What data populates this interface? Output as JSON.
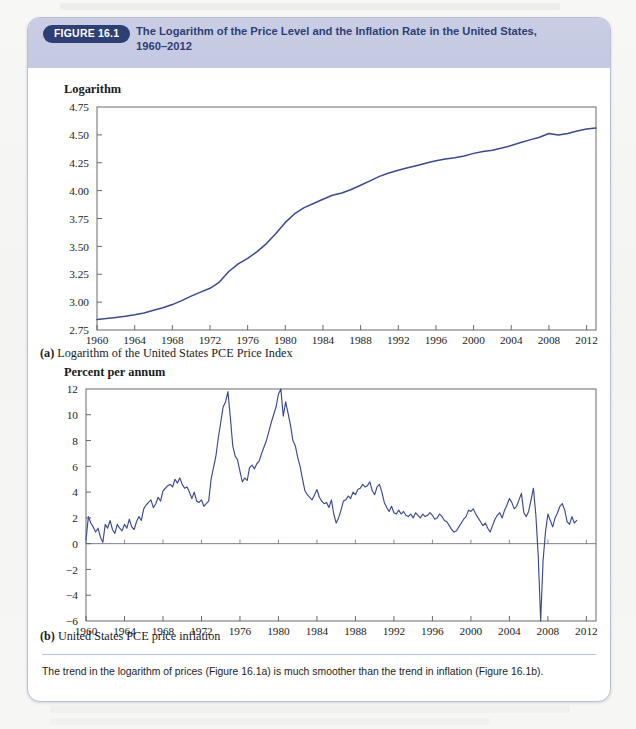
{
  "figure": {
    "badge": "FIGURE 16.1",
    "title_line1": "The Logarithm of the Price Level and the Inflation Rate in the United States,",
    "title_line2": "1960–2012",
    "note": "The trend in the logarithm of prices (Figure 16.1a) is much smoother than the trend in inflation (Figure 16.1b).",
    "accent_color": "#2e3f73",
    "header_color": "#c6cbe3",
    "line_color": "#3a4a8c"
  },
  "panel_a": {
    "caption_label": "(a)",
    "caption_text": "Logarithm of the United States PCE Price Index"
  },
  "panel_b": {
    "caption_label": "(b)",
    "caption_text": "United States PCE price inflation"
  },
  "chart_data": [
    {
      "id": "panel-a",
      "type": "line",
      "title": "",
      "ylabel": "Logarithm",
      "xlabel": "",
      "ylim": [
        2.75,
        4.75
      ],
      "yticks": [
        "2.75",
        "3.00",
        "3.25",
        "3.50",
        "3.75",
        "4.00",
        "4.25",
        "4.50",
        "4.75"
      ],
      "ytick_values": [
        2.75,
        3.0,
        3.25,
        3.5,
        3.75,
        4.0,
        4.25,
        4.5,
        4.75
      ],
      "xlim": [
        1960,
        2013
      ],
      "xticks": [
        "1960",
        "1964",
        "1968",
        "1972",
        "1976",
        "1980",
        "1984",
        "1988",
        "1992",
        "1996",
        "2000",
        "2004",
        "2008",
        "2012"
      ],
      "xtick_values": [
        1960,
        1964,
        1968,
        1972,
        1976,
        1980,
        1984,
        1988,
        1992,
        1996,
        2000,
        2004,
        2008,
        2012
      ],
      "grid": false,
      "legend": "none",
      "series": [
        {
          "name": "Logarithm of United States PCE Price Index",
          "x": [
            1960,
            1961,
            1962,
            1963,
            1964,
            1965,
            1966,
            1967,
            1968,
            1969,
            1970,
            1971,
            1972,
            1973,
            1974,
            1975,
            1976,
            1977,
            1978,
            1979,
            1980,
            1981,
            1982,
            1983,
            1984,
            1985,
            1986,
            1987,
            1988,
            1989,
            1990,
            1991,
            1992,
            1993,
            1994,
            1995,
            1996,
            1997,
            1998,
            1999,
            2000,
            2001,
            2002,
            2003,
            2004,
            2005,
            2006,
            2007,
            2008,
            2009,
            2010,
            2011,
            2012,
            2013
          ],
          "values": [
            2.845,
            2.853,
            2.863,
            2.874,
            2.887,
            2.903,
            2.927,
            2.95,
            2.978,
            3.013,
            3.054,
            3.09,
            3.124,
            3.18,
            3.275,
            3.343,
            3.392,
            3.453,
            3.525,
            3.615,
            3.715,
            3.793,
            3.847,
            3.885,
            3.923,
            3.958,
            3.979,
            4.01,
            4.048,
            4.088,
            4.128,
            4.158,
            4.182,
            4.205,
            4.226,
            4.248,
            4.268,
            4.283,
            4.294,
            4.311,
            4.334,
            4.351,
            4.363,
            4.382,
            4.404,
            4.431,
            4.455,
            4.479,
            4.512,
            4.498,
            4.513,
            4.535,
            4.553,
            4.562
          ]
        }
      ]
    },
    {
      "id": "panel-b",
      "type": "line",
      "title": "",
      "ylabel": "Percent per annum",
      "xlabel": "",
      "ylim": [
        -6,
        12
      ],
      "yticks": [
        "−6",
        "−4",
        "−2",
        "0",
        "2",
        "4",
        "6",
        "8",
        "10",
        "12"
      ],
      "ytick_values": [
        -6,
        -4,
        -2,
        0,
        2,
        4,
        6,
        8,
        10,
        12
      ],
      "xlim": [
        1960,
        2013
      ],
      "xticks": [
        "1960",
        "1964",
        "1968",
        "1972",
        "1976",
        "1980",
        "1984",
        "1988",
        "1992",
        "1996",
        "2000",
        "2004",
        "2008",
        "2012"
      ],
      "xtick_values": [
        1960,
        1964,
        1968,
        1972,
        1976,
        1980,
        1984,
        1988,
        1992,
        1996,
        2000,
        2004,
        2008,
        2012
      ],
      "grid": false,
      "legend": "none",
      "zero_line": 0,
      "series": [
        {
          "name": "United States PCE price inflation",
          "x": [
            1960.0,
            1960.25,
            1960.5,
            1960.75,
            1961.0,
            1961.25,
            1961.5,
            1961.75,
            1962.0,
            1962.25,
            1962.5,
            1962.75,
            1963.0,
            1963.25,
            1963.5,
            1963.75,
            1964.0,
            1964.25,
            1964.5,
            1964.75,
            1965.0,
            1965.25,
            1965.5,
            1965.75,
            1966.0,
            1966.25,
            1966.5,
            1966.75,
            1967.0,
            1967.25,
            1967.5,
            1967.75,
            1968.0,
            1968.25,
            1968.5,
            1968.75,
            1969.0,
            1969.25,
            1969.5,
            1969.75,
            1970.0,
            1970.25,
            1970.5,
            1970.75,
            1971.0,
            1971.25,
            1971.5,
            1971.75,
            1972.0,
            1972.25,
            1972.5,
            1972.75,
            1973.0,
            1973.25,
            1973.5,
            1973.75,
            1974.0,
            1974.25,
            1974.5,
            1974.75,
            1975.0,
            1975.25,
            1975.5,
            1975.75,
            1976.0,
            1976.25,
            1976.5,
            1976.75,
            1977.0,
            1977.25,
            1977.5,
            1977.75,
            1978.0,
            1978.25,
            1978.5,
            1978.75,
            1979.0,
            1979.25,
            1979.5,
            1979.75,
            1980.0,
            1980.25,
            1980.5,
            1980.75,
            1981.0,
            1981.25,
            1981.5,
            1981.75,
            1982.0,
            1982.25,
            1982.5,
            1982.75,
            1983.0,
            1983.25,
            1983.5,
            1983.75,
            1984.0,
            1984.25,
            1984.5,
            1984.75,
            1985.0,
            1985.25,
            1985.5,
            1985.75,
            1986.0,
            1986.25,
            1986.5,
            1986.75,
            1987.0,
            1987.25,
            1987.5,
            1987.75,
            1988.0,
            1988.25,
            1988.5,
            1988.75,
            1989.0,
            1989.25,
            1989.5,
            1989.75,
            1990.0,
            1990.25,
            1990.5,
            1990.75,
            1991.0,
            1991.25,
            1991.5,
            1991.75,
            1992.0,
            1992.25,
            1992.5,
            1992.75,
            1993.0,
            1993.25,
            1993.5,
            1993.75,
            1994.0,
            1994.25,
            1994.5,
            1994.75,
            1995.0,
            1995.25,
            1995.5,
            1995.75,
            1996.0,
            1996.25,
            1996.5,
            1996.75,
            1997.0,
            1997.25,
            1997.5,
            1997.75,
            1998.0,
            1998.25,
            1998.5,
            1998.75,
            1999.0,
            1999.25,
            1999.5,
            1999.75,
            2000.0,
            2000.25,
            2000.5,
            2000.75,
            2001.0,
            2001.25,
            2001.5,
            2001.75,
            2002.0,
            2002.25,
            2002.5,
            2002.75,
            2003.0,
            2003.25,
            2003.5,
            2003.75,
            2004.0,
            2004.25,
            2004.5,
            2004.75,
            2005.0,
            2005.25,
            2005.5,
            2005.75,
            2006.0,
            2006.25,
            2006.5,
            2006.75,
            2007.0,
            2007.25,
            2007.5,
            2007.75,
            2008.0,
            2008.25,
            2008.5,
            2008.75,
            2009.0,
            2009.25,
            2009.5,
            2009.75,
            2010.0,
            2010.25,
            2010.5,
            2010.75,
            2011.0,
            2011.25,
            2011.5,
            2011.75,
            2012.0,
            2012.25,
            2012.5,
            2012.75
          ],
          "values": [
            0.3,
            2.1,
            1.6,
            1.3,
            0.9,
            1.2,
            0.5,
            0.1,
            1.5,
            1.2,
            1.8,
            1.1,
            0.8,
            1.5,
            1.2,
            1.0,
            1.5,
            1.2,
            1.9,
            1.3,
            1.1,
            1.7,
            2.1,
            1.8,
            2.7,
            3.0,
            3.2,
            3.4,
            2.8,
            3.1,
            3.6,
            3.3,
            4.1,
            4.3,
            4.5,
            4.6,
            4.4,
            5.0,
            4.7,
            5.1,
            4.6,
            4.3,
            4.4,
            4.0,
            3.5,
            4.0,
            3.3,
            3.2,
            3.4,
            2.9,
            3.1,
            3.3,
            5.0,
            5.9,
            6.8,
            8.2,
            9.4,
            10.6,
            11.0,
            11.8,
            9.8,
            7.6,
            6.8,
            6.5,
            5.6,
            4.8,
            5.1,
            4.9,
            5.9,
            6.1,
            5.8,
            6.2,
            6.4,
            7.0,
            7.5,
            8.0,
            8.7,
            9.4,
            10.0,
            10.6,
            11.6,
            12.0,
            9.9,
            11.0,
            10.1,
            9.2,
            8.0,
            7.6,
            6.7,
            6.0,
            5.0,
            4.1,
            3.8,
            3.6,
            3.4,
            3.8,
            4.2,
            3.6,
            3.3,
            3.1,
            3.2,
            2.8,
            3.4,
            2.3,
            1.6,
            2.0,
            2.6,
            3.3,
            3.4,
            3.7,
            3.5,
            4.0,
            3.8,
            4.2,
            4.3,
            4.6,
            4.4,
            4.5,
            4.8,
            4.1,
            3.8,
            4.4,
            4.6,
            4.0,
            3.2,
            2.8,
            2.5,
            2.9,
            2.4,
            2.3,
            2.6,
            2.3,
            2.5,
            2.2,
            2.1,
            2.3,
            2.0,
            2.4,
            2.2,
            2.0,
            2.3,
            2.1,
            2.2,
            2.4,
            2.2,
            1.9,
            2.0,
            2.3,
            2.1,
            1.8,
            1.7,
            1.4,
            1.1,
            0.9,
            1.0,
            1.3,
            1.6,
            1.9,
            2.1,
            2.6,
            2.5,
            2.7,
            2.3,
            2.0,
            1.7,
            1.4,
            1.6,
            1.2,
            0.9,
            1.4,
            1.9,
            2.2,
            2.4,
            2.0,
            2.6,
            3.0,
            3.5,
            3.2,
            2.7,
            2.9,
            3.4,
            3.9,
            2.4,
            2.1,
            2.5,
            3.4,
            4.3,
            2.2,
            -1.0,
            -6.0,
            -1.3,
            0.9,
            2.3,
            1.8,
            1.3,
            2.0,
            2.4,
            2.9,
            3.1,
            2.6,
            1.7,
            1.5,
            2.1,
            1.6,
            1.8
          ]
        }
      ]
    }
  ]
}
